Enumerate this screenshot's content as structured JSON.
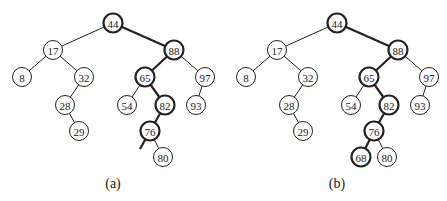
{
  "figure": {
    "trees": [
      {
        "id": "a",
        "caption": "(a)",
        "offset_x": 0,
        "nodes": [
          {
            "key": "44",
            "x": 113,
            "y": 23,
            "highlight": true
          },
          {
            "key": "17",
            "x": 53,
            "y": 50,
            "highlight": false
          },
          {
            "key": "88",
            "x": 174,
            "y": 50,
            "highlight": true
          },
          {
            "key": "8",
            "x": 22,
            "y": 77,
            "highlight": false
          },
          {
            "key": "32",
            "x": 84,
            "y": 77,
            "highlight": false
          },
          {
            "key": "65",
            "x": 145,
            "y": 77,
            "highlight": true
          },
          {
            "key": "97",
            "x": 205,
            "y": 77,
            "highlight": false
          },
          {
            "key": "28",
            "x": 65,
            "y": 105,
            "highlight": false
          },
          {
            "key": "54",
            "x": 127,
            "y": 105,
            "highlight": false
          },
          {
            "key": "82",
            "x": 165,
            "y": 105,
            "highlight": true
          },
          {
            "key": "93",
            "x": 196,
            "y": 105,
            "highlight": false
          },
          {
            "key": "29",
            "x": 79,
            "y": 131,
            "highlight": false
          },
          {
            "key": "76",
            "x": 150,
            "y": 131,
            "highlight": true
          },
          {
            "key": "80",
            "x": 163,
            "y": 157,
            "highlight": false
          }
        ],
        "edges": [
          {
            "from": "44",
            "to": "17",
            "highlight": false
          },
          {
            "from": "44",
            "to": "88",
            "highlight": true
          },
          {
            "from": "17",
            "to": "8",
            "highlight": false
          },
          {
            "from": "17",
            "to": "32",
            "highlight": false
          },
          {
            "from": "32",
            "to": "28",
            "highlight": false
          },
          {
            "from": "28",
            "to": "29",
            "highlight": false
          },
          {
            "from": "88",
            "to": "65",
            "highlight": true
          },
          {
            "from": "88",
            "to": "97",
            "highlight": false
          },
          {
            "from": "65",
            "to": "54",
            "highlight": false
          },
          {
            "from": "65",
            "to": "82",
            "highlight": true
          },
          {
            "from": "97",
            "to": "93",
            "highlight": false
          },
          {
            "from": "82",
            "to": "76",
            "highlight": true
          },
          {
            "from": "76",
            "to": "80",
            "highlight": false
          }
        ],
        "stub_edges": [
          {
            "from": "76",
            "x2": 140,
            "y2": 149,
            "highlight": true
          }
        ]
      },
      {
        "id": "b",
        "caption": "(b)",
        "offset_x": 224,
        "nodes": [
          {
            "key": "44",
            "x": 113,
            "y": 23,
            "highlight": true
          },
          {
            "key": "17",
            "x": 53,
            "y": 50,
            "highlight": false
          },
          {
            "key": "88",
            "x": 174,
            "y": 50,
            "highlight": true
          },
          {
            "key": "8",
            "x": 22,
            "y": 77,
            "highlight": false
          },
          {
            "key": "32",
            "x": 84,
            "y": 77,
            "highlight": false
          },
          {
            "key": "65",
            "x": 145,
            "y": 77,
            "highlight": true
          },
          {
            "key": "97",
            "x": 205,
            "y": 77,
            "highlight": false
          },
          {
            "key": "28",
            "x": 65,
            "y": 105,
            "highlight": false
          },
          {
            "key": "54",
            "x": 127,
            "y": 105,
            "highlight": false
          },
          {
            "key": "82",
            "x": 165,
            "y": 105,
            "highlight": true
          },
          {
            "key": "93",
            "x": 196,
            "y": 105,
            "highlight": false
          },
          {
            "key": "29",
            "x": 79,
            "y": 131,
            "highlight": false
          },
          {
            "key": "76",
            "x": 150,
            "y": 131,
            "highlight": true
          },
          {
            "key": "68",
            "x": 137,
            "y": 157,
            "highlight": true
          },
          {
            "key": "80",
            "x": 163,
            "y": 157,
            "highlight": false
          }
        ],
        "edges": [
          {
            "from": "44",
            "to": "17",
            "highlight": false
          },
          {
            "from": "44",
            "to": "88",
            "highlight": true
          },
          {
            "from": "17",
            "to": "8",
            "highlight": false
          },
          {
            "from": "17",
            "to": "32",
            "highlight": false
          },
          {
            "from": "32",
            "to": "28",
            "highlight": false
          },
          {
            "from": "28",
            "to": "29",
            "highlight": false
          },
          {
            "from": "88",
            "to": "65",
            "highlight": true
          },
          {
            "from": "88",
            "to": "97",
            "highlight": false
          },
          {
            "from": "65",
            "to": "54",
            "highlight": false
          },
          {
            "from": "65",
            "to": "82",
            "highlight": true
          },
          {
            "from": "97",
            "to": "93",
            "highlight": false
          },
          {
            "from": "82",
            "to": "76",
            "highlight": true
          },
          {
            "from": "76",
            "to": "68",
            "highlight": true
          },
          {
            "from": "76",
            "to": "80",
            "highlight": false
          }
        ],
        "stub_edges": []
      }
    ],
    "caption_y": 183,
    "node_radius": 9.5,
    "colors": {
      "stroke": "#222222",
      "fill": "#ffffff"
    }
  }
}
